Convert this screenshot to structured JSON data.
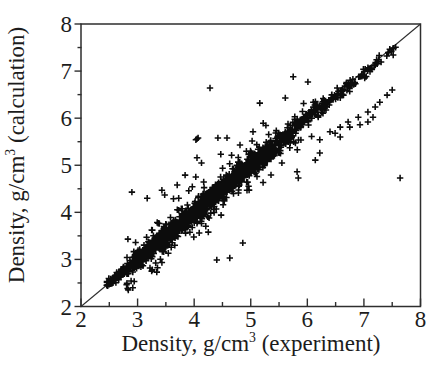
{
  "figure": {
    "background": "#ffffff",
    "frame_color": "#2e2e2e",
    "tick_label_color": "#1c1c1c",
    "marker": {
      "symbol": "plus",
      "color": "#0c0c0c",
      "arm": 3.2,
      "stroke": 1.55
    },
    "identity_line": {
      "from": [
        2,
        2
      ],
      "to": [
        8,
        8
      ],
      "color": "#2e2e2e",
      "width": 1.1
    }
  },
  "axes": {
    "x": {
      "label": {
        "pre": "Density, g/cm",
        "sup": "3",
        "post": " (experiment)"
      },
      "min": 2,
      "max": 8,
      "major_ticks": [
        2,
        3,
        4,
        5,
        6,
        7,
        8
      ],
      "minor_ticks": [
        2.5,
        3.5,
        4.5,
        5.5,
        6.5,
        7.5
      ],
      "tick_labels": [
        "2",
        "3",
        "4",
        "5",
        "6",
        "7",
        "8"
      ]
    },
    "y": {
      "label": {
        "pre": "Density, g/cm",
        "sup": "3",
        "post": " (calculation)"
      },
      "min": 2,
      "max": 8,
      "major_ticks": [
        2,
        3,
        4,
        5,
        6,
        7,
        8
      ],
      "minor_ticks": [
        2.5,
        3.5,
        4.5,
        5.5,
        6.5,
        7.5
      ],
      "tick_labels": [
        "2",
        "3",
        "4",
        "5",
        "6",
        "7",
        "8"
      ]
    }
  },
  "chart_data": {
    "type": "scatter",
    "title": "",
    "xlabel": "Density, g/cm3 (experiment)",
    "ylabel": "Density, g/cm3 (calculation)",
    "xlim": [
      2,
      8
    ],
    "ylim": [
      2,
      8
    ],
    "grid": false,
    "legend": "none",
    "identity_line": true,
    "series": [
      {
        "name": "main-band",
        "generated": true,
        "seed": 1337,
        "note": "dense cloud of + markers along y=x; segments are [x_start, x_end, n_points, sd_of_y_minus_x]",
        "segments": [
          [
            2.45,
            2.9,
            130,
            0.05
          ],
          [
            2.9,
            3.4,
            250,
            0.08
          ],
          [
            3.4,
            4.0,
            300,
            0.1
          ],
          [
            4.0,
            4.6,
            290,
            0.11
          ],
          [
            4.6,
            5.2,
            250,
            0.11
          ],
          [
            5.2,
            5.8,
            150,
            0.1
          ],
          [
            5.8,
            6.4,
            90,
            0.085
          ],
          [
            6.4,
            6.9,
            50,
            0.07
          ],
          [
            6.9,
            7.3,
            25,
            0.06
          ],
          [
            7.3,
            7.58,
            10,
            0.05
          ]
        ],
        "high_x_bias": -0.04
      },
      {
        "name": "halo",
        "generated": true,
        "seed": 2024,
        "note": "looser scatter around the band; segments are [x_start, x_end, n_points, sd, min_abs_deviation]",
        "segments": [
          [
            2.8,
            3.8,
            45,
            0.3,
            0.15
          ],
          [
            3.8,
            5.0,
            55,
            0.33,
            0.15
          ],
          [
            5.0,
            6.2,
            30,
            0.3,
            0.15
          ]
        ],
        "max_abs_deviation": 0.8
      },
      {
        "name": "outliers",
        "points": [
          [
            5.84,
            4.73
          ],
          [
            6.14,
            5.11
          ],
          [
            6.22,
            5.26
          ],
          [
            6.22,
            5.54
          ],
          [
            6.4,
            5.71
          ],
          [
            6.49,
            5.68
          ],
          [
            6.58,
            5.6
          ],
          [
            6.58,
            5.81
          ],
          [
            6.72,
            5.92
          ],
          [
            6.75,
            5.81
          ],
          [
            6.9,
            6.02
          ],
          [
            6.93,
            5.86
          ],
          [
            7.07,
            5.92
          ],
          [
            7.07,
            6.13
          ],
          [
            7.16,
            6.02
          ],
          [
            7.2,
            6.24
          ],
          [
            7.28,
            6.34
          ],
          [
            7.41,
            6.49
          ],
          [
            7.5,
            6.6
          ],
          [
            7.64,
            4.73
          ],
          [
            4.28,
            6.64
          ],
          [
            5.16,
            6.32
          ],
          [
            5.61,
            6.43
          ],
          [
            5.75,
            6.88
          ],
          [
            6.01,
            6.77
          ],
          [
            2.9,
            4.43
          ],
          [
            3.17,
            4.3
          ],
          [
            3.43,
            4.47
          ],
          [
            3.48,
            4.37
          ],
          [
            3.7,
            4.58
          ],
          [
            3.84,
            4.79
          ],
          [
            4.05,
            5.16
          ],
          [
            4.13,
            5.05
          ],
          [
            4.05,
            5.56
          ],
          [
            4.07,
            5.58
          ],
          [
            4.03,
            5.54
          ],
          [
            4.42,
            5.58
          ],
          [
            4.58,
            5.58
          ],
          [
            4.81,
            5.43
          ],
          [
            5.04,
            5.71
          ],
          [
            3.22,
            2.82
          ],
          [
            3.34,
            2.73
          ],
          [
            3.26,
            2.78
          ],
          [
            4.4,
            2.99
          ],
          [
            4.63,
            3.03
          ],
          [
            4.86,
            3.35
          ],
          [
            4.05,
            3.77
          ],
          [
            4.25,
            3.58
          ],
          [
            5.55,
            5.05
          ],
          [
            5.82,
            4.86
          ]
        ]
      }
    ]
  }
}
